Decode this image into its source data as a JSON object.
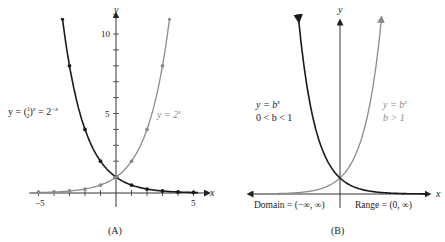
{
  "colors": {
    "dark_curve": "#1a1a1a",
    "light_curve": "#8a8a8a",
    "axis": "#333333",
    "text_dark": "#222222",
    "text_light": "#8a8a8a"
  },
  "panel_a": {
    "caption": "(A)",
    "x_axis_label": "x",
    "y_axis_label": "y",
    "x_tick_labels": [
      "−5",
      "5"
    ],
    "y_tick_labels": [
      "5",
      "10"
    ],
    "dark_curve_label": {
      "lhs": "y = (",
      "frac_num": "1",
      "frac_den": "2",
      "rhs": ")",
      "exp": "x",
      "eq2": " = 2",
      "exp2": "−x"
    },
    "light_curve_label": {
      "lhs": "y = 2",
      "exp": "x"
    }
  },
  "panel_b": {
    "caption": "(B)",
    "x_axis_label": "x",
    "y_axis_label": "y",
    "dark_curve_label": {
      "line1_base": "y = b",
      "line1_exp": "x",
      "line2": "0 < b < 1"
    },
    "light_curve_label": {
      "line1_base": "y = b",
      "line1_exp": "x",
      "line2": "b > 1"
    },
    "domain_label": "Domain = (−∞, ∞)",
    "range_label": "Range = (0, ∞)"
  },
  "chart_data": [
    {
      "type": "line",
      "title": "(A)",
      "xlabel": "x",
      "ylabel": "y",
      "xlim": [
        -5,
        5
      ],
      "ylim": [
        0,
        11
      ],
      "x_ticks": [
        -5,
        -4,
        -3,
        -2,
        -1,
        0,
        1,
        2,
        3,
        4,
        5
      ],
      "y_ticks": [
        1,
        2,
        3,
        4,
        5,
        6,
        7,
        8,
        9,
        10
      ],
      "series": [
        {
          "name": "y = (1/2)^x = 2^(−x)",
          "color": "#1a1a1a",
          "x": [
            -3,
            -2,
            -1,
            0,
            1,
            2,
            3,
            4,
            5
          ],
          "values": [
            8,
            4,
            2,
            1,
            0.5,
            0.25,
            0.125,
            0.0625,
            0.03125
          ]
        },
        {
          "name": "y = 2^x",
          "color": "#8a8a8a",
          "x": [
            -5,
            -4,
            -3,
            -2,
            -1,
            0,
            1,
            2,
            3
          ],
          "values": [
            0.03125,
            0.0625,
            0.125,
            0.25,
            0.5,
            1,
            2,
            4,
            8
          ]
        }
      ],
      "grid": false
    },
    {
      "type": "line",
      "title": "(B)",
      "xlabel": "x",
      "ylabel": "y",
      "series": [
        {
          "name": "y = b^x, 0 < b < 1",
          "color": "#1a1a1a"
        },
        {
          "name": "y = b^x, b > 1",
          "color": "#8a8a8a"
        }
      ],
      "annotations": [
        "Domain = (−∞, ∞)",
        "Range = (0, ∞)"
      ],
      "grid": false
    }
  ]
}
